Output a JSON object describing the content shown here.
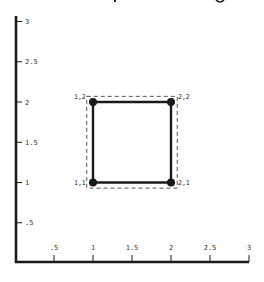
{
  "chart_data": {
    "type": "scatter",
    "title": "",
    "xlabel": "",
    "ylabel": "",
    "xlim": [
      0,
      3
    ],
    "ylim": [
      0,
      3
    ],
    "grid": false,
    "x_ticks": [
      ".5",
      "1",
      "1.5",
      "2",
      "2.5",
      "3"
    ],
    "y_ticks": [
      ".5",
      "1",
      "1.5",
      "2",
      "2.5",
      "3"
    ],
    "points": [
      {
        "x": 1,
        "y": 2,
        "label": "1,2"
      },
      {
        "x": 2,
        "y": 2,
        "label": "2,2"
      },
      {
        "x": 1,
        "y": 1,
        "label": "1,1"
      },
      {
        "x": 2,
        "y": 1,
        "label": "2,1"
      }
    ],
    "shapes": [
      {
        "kind": "square",
        "style": "solid",
        "vertices": [
          [
            1,
            1
          ],
          [
            2,
            1
          ],
          [
            2,
            2
          ],
          [
            1,
            2
          ]
        ]
      },
      {
        "kind": "bounding-box",
        "style": "dashed",
        "x": [
          0.92,
          2.08
        ],
        "y": [
          0.93,
          2.07
        ]
      }
    ]
  },
  "axes": {
    "x_ticks": [
      {
        "label": ".5",
        "value": 0.5
      },
      {
        "label": "1",
        "value": 1
      },
      {
        "label": "1.5",
        "value": 1.5
      },
      {
        "label": "2",
        "value": 2
      },
      {
        "label": "2.5",
        "value": 2.5
      },
      {
        "label": "3",
        "value": 3
      }
    ],
    "y_ticks": [
      {
        "label": ".5",
        "value": 0.5
      },
      {
        "label": "1",
        "value": 1
      },
      {
        "label": "1.5",
        "value": 1.5
      },
      {
        "label": "2",
        "value": 2
      },
      {
        "label": "2.5",
        "value": 2.5
      },
      {
        "label": "3",
        "value": 3
      }
    ]
  },
  "colors": {
    "ink": "#1a1a1a",
    "dashed": "#555555",
    "background": "#ffffff"
  }
}
